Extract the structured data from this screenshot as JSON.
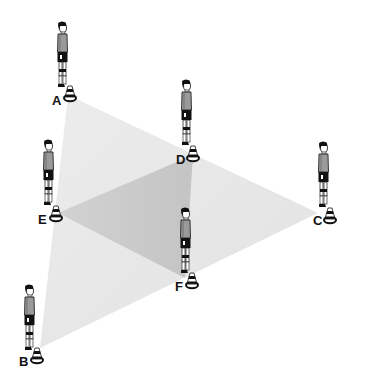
{
  "diagram": {
    "title": "",
    "colors": {
      "outer_triangle": "#e8e8e8",
      "inner_triangle": "#c9c9c9",
      "ink": "#111111"
    },
    "positions": [
      {
        "id": "A",
        "label": "A",
        "player": {
          "x": 55,
          "y": 22
        },
        "cone": {
          "x": 70,
          "y": 86
        },
        "label_pos": {
          "x": 52,
          "y": 94
        }
      },
      {
        "id": "D",
        "label": "D",
        "player": {
          "x": 179,
          "y": 80
        },
        "cone": {
          "x": 193,
          "y": 146
        },
        "label_pos": {
          "x": 176,
          "y": 153
        }
      },
      {
        "id": "C",
        "label": "C",
        "player": {
          "x": 316,
          "y": 142
        },
        "cone": {
          "x": 330,
          "y": 208
        },
        "label_pos": {
          "x": 313,
          "y": 214
        }
      },
      {
        "id": "E",
        "label": "E",
        "player": {
          "x": 41,
          "y": 140
        },
        "cone": {
          "x": 56,
          "y": 206
        },
        "label_pos": {
          "x": 38,
          "y": 213
        }
      },
      {
        "id": "F",
        "label": "F",
        "player": {
          "x": 178,
          "y": 208
        },
        "cone": {
          "x": 192,
          "y": 273
        },
        "label_pos": {
          "x": 175,
          "y": 280
        }
      },
      {
        "id": "B",
        "label": "B",
        "player": {
          "x": 22,
          "y": 285
        },
        "cone": {
          "x": 37,
          "y": 348
        },
        "label_pos": {
          "x": 19,
          "y": 355
        }
      }
    ],
    "triangles": {
      "outer": {
        "vertices": [
          "A",
          "C",
          "B"
        ],
        "points": "68,95 318,213 40,348"
      },
      "inner": {
        "vertices": [
          "E",
          "D",
          "F"
        ],
        "points": "58,213 193,155 185,278"
      }
    }
  }
}
